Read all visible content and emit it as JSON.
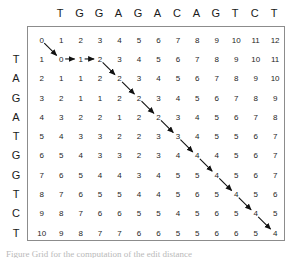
{
  "figure": {
    "type": "edit-distance-dp-matrix",
    "caption": "Figure  Grid for the computation of the edit distance",
    "colors": {
      "grid_border": "#8c8c8c",
      "text": "#262626",
      "header_text": "#1a1a1a",
      "arrow": "#111111",
      "background": "#ffffff"
    }
  },
  "chart_data": {
    "type": "table",
    "title": "",
    "xlabel": "",
    "ylabel": "",
    "column_sequence": [
      "T",
      "G",
      "G",
      "A",
      "G",
      "A",
      "C",
      "A",
      "G",
      "T",
      "C",
      "T"
    ],
    "row_sequence": [
      "T",
      "A",
      "G",
      "A",
      "T",
      "G",
      "G",
      "T",
      "C",
      "T"
    ],
    "column_headers": [
      "T",
      "G",
      "G",
      "A",
      "G",
      "A",
      "C",
      "A",
      "G",
      "T",
      "C",
      "T"
    ],
    "row_headers": [
      "T",
      "A",
      "G",
      "A",
      "T",
      "G",
      "G",
      "T",
      "C",
      "T"
    ],
    "matrix": [
      [
        0,
        1,
        2,
        3,
        4,
        5,
        6,
        7,
        8,
        9,
        10,
        11,
        12
      ],
      [
        1,
        0,
        1,
        2,
        3,
        4,
        5,
        6,
        7,
        8,
        9,
        10,
        11
      ],
      [
        2,
        1,
        1,
        2,
        2,
        3,
        4,
        5,
        6,
        7,
        8,
        9,
        10
      ],
      [
        3,
        2,
        1,
        1,
        2,
        2,
        3,
        4,
        5,
        6,
        7,
        8,
        9
      ],
      [
        4,
        3,
        2,
        2,
        1,
        2,
        2,
        3,
        4,
        5,
        6,
        7,
        8
      ],
      [
        5,
        4,
        3,
        3,
        2,
        2,
        3,
        3,
        4,
        5,
        5,
        6,
        7
      ],
      [
        6,
        5,
        4,
        3,
        3,
        2,
        3,
        4,
        4,
        4,
        5,
        6,
        7
      ],
      [
        7,
        6,
        5,
        4,
        4,
        3,
        4,
        5,
        5,
        4,
        5,
        6,
        7
      ],
      [
        8,
        7,
        6,
        5,
        5,
        4,
        4,
        5,
        6,
        5,
        4,
        5,
        6
      ],
      [
        9,
        8,
        7,
        6,
        6,
        5,
        5,
        4,
        5,
        6,
        5,
        4,
        5
      ],
      [
        10,
        9,
        8,
        7,
        7,
        6,
        6,
        5,
        5,
        6,
        6,
        5,
        4
      ]
    ],
    "traceback_path": [
      {
        "row": 0,
        "col": 0,
        "value": 0
      },
      {
        "row": 1,
        "col": 1,
        "value": 0
      },
      {
        "row": 1,
        "col": 2,
        "value": 1
      },
      {
        "row": 1,
        "col": 3,
        "value": 2
      },
      {
        "row": 2,
        "col": 4,
        "value": 2
      },
      {
        "row": 3,
        "col": 5,
        "value": 2
      },
      {
        "row": 4,
        "col": 6,
        "value": 2
      },
      {
        "row": 5,
        "col": 7,
        "value": 3
      },
      {
        "row": 6,
        "col": 8,
        "value": 4
      },
      {
        "row": 7,
        "col": 9,
        "value": 4
      },
      {
        "row": 8,
        "col": 10,
        "value": 4
      },
      {
        "row": 9,
        "col": 11,
        "value": 4
      },
      {
        "row": 10,
        "col": 12,
        "value": 4
      }
    ],
    "arrows": [
      {
        "from": [
          0,
          0
        ],
        "to": [
          1,
          1
        ],
        "kind": "diagonal"
      },
      {
        "from": [
          1,
          1
        ],
        "to": [
          1,
          2
        ],
        "kind": "horizontal"
      },
      {
        "from": [
          1,
          2
        ],
        "to": [
          1,
          3
        ],
        "kind": "horizontal"
      },
      {
        "from": [
          1,
          3
        ],
        "to": [
          2,
          4
        ],
        "kind": "diagonal"
      },
      {
        "from": [
          2,
          4
        ],
        "to": [
          3,
          5
        ],
        "kind": "diagonal"
      },
      {
        "from": [
          3,
          5
        ],
        "to": [
          4,
          6
        ],
        "kind": "diagonal"
      },
      {
        "from": [
          4,
          6
        ],
        "to": [
          5,
          7
        ],
        "kind": "diagonal"
      },
      {
        "from": [
          5,
          7
        ],
        "to": [
          6,
          8
        ],
        "kind": "diagonal"
      },
      {
        "from": [
          6,
          8
        ],
        "to": [
          7,
          9
        ],
        "kind": "diagonal"
      },
      {
        "from": [
          7,
          9
        ],
        "to": [
          8,
          10
        ],
        "kind": "diagonal"
      },
      {
        "from": [
          8,
          10
        ],
        "to": [
          9,
          11
        ],
        "kind": "diagonal"
      },
      {
        "from": [
          9,
          11
        ],
        "to": [
          10,
          12
        ],
        "kind": "diagonal"
      }
    ],
    "edit_distance": 4,
    "grid": false,
    "legend": null
  }
}
